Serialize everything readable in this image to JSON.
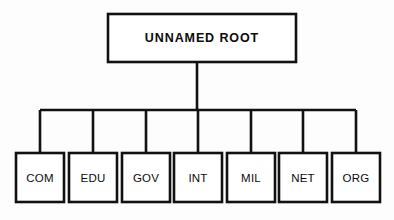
{
  "diagram": {
    "type": "tree",
    "background_color": "#fdfdfd",
    "line_color": "#111111",
    "box_fill_color": "#ffffff",
    "text_color": "#0b0b0b",
    "root": {
      "label": "UNNAMED ROOT",
      "x": 108,
      "y": 14,
      "width": 188,
      "height": 48,
      "center_x": 202,
      "center_y": 38,
      "bold": true
    },
    "stem": {
      "x": 197,
      "y_top": 62,
      "y_bottom": 110
    },
    "bus": {
      "y": 110,
      "x_start": 40,
      "x_end": 356
    },
    "leaf_geometry": {
      "y_top": 153,
      "y_bottom": 202,
      "height": 49,
      "width": 48,
      "label_center_y": 178
    },
    "children": [
      {
        "label": "COM",
        "connector_x": 40,
        "box_x": 16,
        "center_x": 40
      },
      {
        "label": "EDU",
        "connector_x": 93,
        "box_x": 69,
        "center_x": 93
      },
      {
        "label": "GOV",
        "connector_x": 146,
        "box_x": 122,
        "center_x": 146
      },
      {
        "label": "INT",
        "connector_x": 198,
        "box_x": 174,
        "center_x": 198
      },
      {
        "label": "MIL",
        "connector_x": 251,
        "box_x": 227,
        "center_x": 251
      },
      {
        "label": "NET",
        "connector_x": 303,
        "box_x": 279,
        "center_x": 303
      },
      {
        "label": "ORG",
        "connector_x": 356,
        "box_x": 332,
        "center_x": 356
      }
    ]
  }
}
